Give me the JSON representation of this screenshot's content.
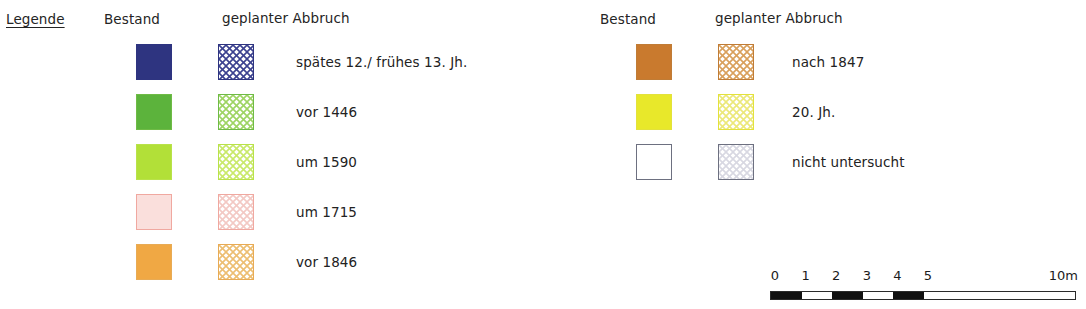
{
  "legend": {
    "title": "Legende",
    "groups": [
      {
        "id": "group-left",
        "headers": {
          "solid": "Bestand",
          "hatched": "geplanter Abbruch"
        },
        "items": [
          {
            "label": "spätes 12./ frühes 13. Jh.",
            "solid_color": "#2e3480",
            "hatch_color": "#3c4290",
            "border_color": "#2e3480"
          },
          {
            "label": "vor 1446",
            "solid_color": "#5cb33c",
            "hatch_color": "#9ed463",
            "border_color": "#6fbb46"
          },
          {
            "label": "um 1590",
            "solid_color": "#b2e038",
            "hatch_color": "#c9e96a",
            "border_color": "#b9e24a"
          },
          {
            "label": "um 1715",
            "solid_color": "#fadfdc",
            "hatch_color": "#f3c9c4",
            "border_color": "#f0a8a0"
          },
          {
            "label": "vor 1846",
            "solid_color": "#f0a844",
            "hatch_color": "#edbe72",
            "border_color": "#e8ab55"
          }
        ]
      },
      {
        "id": "group-right",
        "headers": {
          "solid": "Bestand",
          "hatched": "geplanter Abbruch"
        },
        "items": [
          {
            "label": "nach 1847",
            "solid_color": "#c97a2e",
            "hatch_color": "#d9a05c",
            "border_color": "#c07c36"
          },
          {
            "label": "20. Jh.",
            "solid_color": "#e8e82a",
            "hatch_color": "#ece879",
            "border_color": "#e3e23c"
          },
          {
            "label": "nicht untersucht",
            "solid_color": "#ffffff",
            "hatch_color": "#d8d8e2",
            "border_color": "#6d7080"
          }
        ]
      }
    ]
  },
  "scale": {
    "tick_labels": [
      "0",
      "1",
      "2",
      "3",
      "4",
      "5"
    ],
    "end_label": "10m",
    "segments_filled": [
      0,
      2,
      4
    ],
    "unit_count": 10
  }
}
